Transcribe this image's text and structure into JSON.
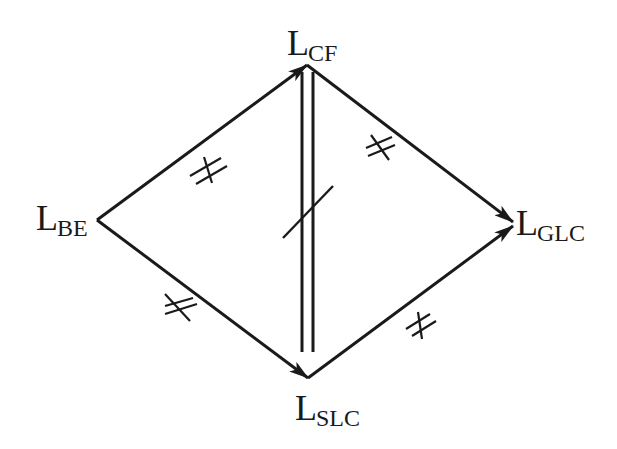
{
  "diagram": {
    "type": "directed-graph",
    "colors": {
      "stroke": "#1a1a1a",
      "background": "#ffffff"
    },
    "nodes": [
      {
        "id": "BE",
        "main": "L",
        "sub": "BE",
        "x": 97,
        "y": 220
      },
      {
        "id": "CF",
        "main": "L",
        "sub": "CF",
        "x": 307,
        "y": 65
      },
      {
        "id": "GLC",
        "main": "L",
        "sub": "GLC",
        "x": 513,
        "y": 225
      },
      {
        "id": "SLC",
        "main": "L",
        "sub": "SLC",
        "x": 308,
        "y": 378
      }
    ],
    "edges": [
      {
        "from": "BE",
        "to": "CF",
        "directed": true,
        "mark": "not-equivalent"
      },
      {
        "from": "BE",
        "to": "SLC",
        "directed": true,
        "mark": "not-equivalent"
      },
      {
        "from": "CF",
        "to": "GLC",
        "directed": true,
        "mark": "not-equivalent"
      },
      {
        "from": "SLC",
        "to": "GLC",
        "directed": true,
        "mark": "not-equivalent"
      },
      {
        "from": "CF",
        "to": "SLC",
        "directed": false,
        "style": "double-line",
        "mark": "negated (slash)"
      }
    ]
  }
}
